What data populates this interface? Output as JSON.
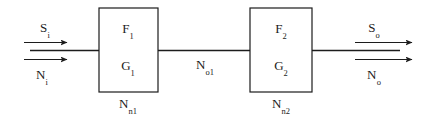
{
  "diagram": {
    "type": "block-diagram",
    "canvas": {
      "width": 422,
      "height": 116,
      "background": "#ffffff"
    },
    "stroke_color": "#1c1c1c",
    "blocks": [
      {
        "id": "block-1",
        "top_label": "F",
        "top_label_sub": "1",
        "bottom_label": "G",
        "bottom_label_sub": "1",
        "caption": "N",
        "caption_sub": "n1",
        "x": 99,
        "y": 8,
        "width": 59,
        "height": 84
      },
      {
        "id": "block-2",
        "top_label": "F",
        "top_label_sub": "2",
        "bottom_label": "G",
        "bottom_label_sub": "2",
        "caption": "N",
        "caption_sub": "n2",
        "x": 250,
        "y": 8,
        "width": 62,
        "height": 84
      }
    ],
    "inputs": [
      {
        "id": "signal-in",
        "label": "S",
        "label_sub": "i",
        "position": "above-arrow"
      },
      {
        "id": "noise-in",
        "label": "N",
        "label_sub": "i",
        "position": "below-arrow"
      }
    ],
    "interstage": {
      "id": "interstage-noise",
      "label": "N",
      "label_sub": "o1"
    },
    "outputs": [
      {
        "id": "signal-out",
        "label": "S",
        "label_sub": "o",
        "position": "above-arrow"
      },
      {
        "id": "noise-out",
        "label": "N",
        "label_sub": "o",
        "position": "below-arrow"
      }
    ]
  }
}
